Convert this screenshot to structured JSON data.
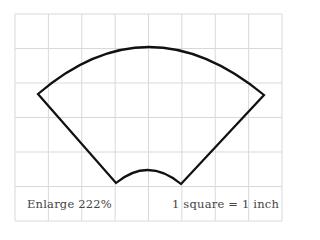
{
  "diagram": {
    "type": "pattern-template",
    "shape": "annular-sector",
    "grid": {
      "columns": 8,
      "rows": 6,
      "x0": 15,
      "y0": 14,
      "x1": 282,
      "y1": 221,
      "line_color": "#d9d9d9"
    },
    "shape_style": {
      "stroke": "#111111",
      "stroke_width": 2.2
    },
    "vertices": {
      "outer_left": [
        38,
        94
      ],
      "outer_right": [
        264,
        95
      ],
      "outer_top": [
        148,
        47
      ],
      "inner_left": [
        116,
        183
      ],
      "inner_right": [
        181,
        184
      ],
      "inner_top": [
        148,
        170
      ]
    }
  },
  "labels": {
    "enlarge": "Enlarge 222%",
    "scale": "1 square = 1 inch"
  },
  "colors": {
    "text": "#444444",
    "background": "#ffffff"
  }
}
